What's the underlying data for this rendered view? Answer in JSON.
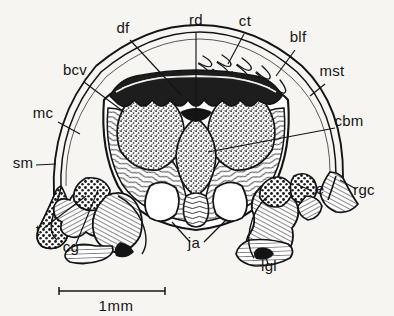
{
  "figure": {
    "kind": "anatomical-line-drawing",
    "subject": "transverse section through mollusc body showing mantle, gill filaments and visceral mass",
    "ink_color": "#141414",
    "background_color": "#f7f5f2",
    "labels": [
      {
        "id": "df",
        "text": "df",
        "x": 123,
        "y": 33,
        "anchor": "middle"
      },
      {
        "id": "rd",
        "text": "rd",
        "x": 196,
        "y": 25,
        "anchor": "middle"
      },
      {
        "id": "ct",
        "text": "ct",
        "x": 245,
        "y": 26,
        "anchor": "middle"
      },
      {
        "id": "blf",
        "text": "blf",
        "x": 298,
        "y": 42,
        "anchor": "middle"
      },
      {
        "id": "mst",
        "text": "mst",
        "x": 332,
        "y": 76,
        "anchor": "middle"
      },
      {
        "id": "cbm",
        "text": "cbm",
        "x": 349,
        "y": 126,
        "anchor": "middle"
      },
      {
        "id": "bcv",
        "text": "bcv",
        "x": 75,
        "y": 75,
        "anchor": "middle"
      },
      {
        "id": "mc",
        "text": "mc",
        "x": 43,
        "y": 118,
        "anchor": "middle"
      },
      {
        "id": "sm",
        "text": "sm",
        "x": 23,
        "y": 168,
        "anchor": "middle"
      },
      {
        "id": "t",
        "text": "t",
        "x": 38,
        "y": 235,
        "anchor": "middle"
      },
      {
        "id": "cg",
        "text": "cg",
        "x": 71,
        "y": 252,
        "anchor": "middle"
      },
      {
        "id": "ja",
        "text": "ja",
        "x": 194,
        "y": 248,
        "anchor": "middle"
      },
      {
        "id": "lgl",
        "text": "lgl",
        "x": 269,
        "y": 271,
        "anchor": "middle"
      },
      {
        "id": "e",
        "text": "e",
        "x": 320,
        "y": 194,
        "anchor": "middle"
      },
      {
        "id": "rgc",
        "text": "rgc",
        "x": 364,
        "y": 195,
        "anchor": "middle"
      }
    ],
    "scale_bar": {
      "label": "1mm",
      "label_x": 116,
      "label_y": 311,
      "x1": 59,
      "x2": 165,
      "y": 291,
      "cap_height": 8
    }
  }
}
